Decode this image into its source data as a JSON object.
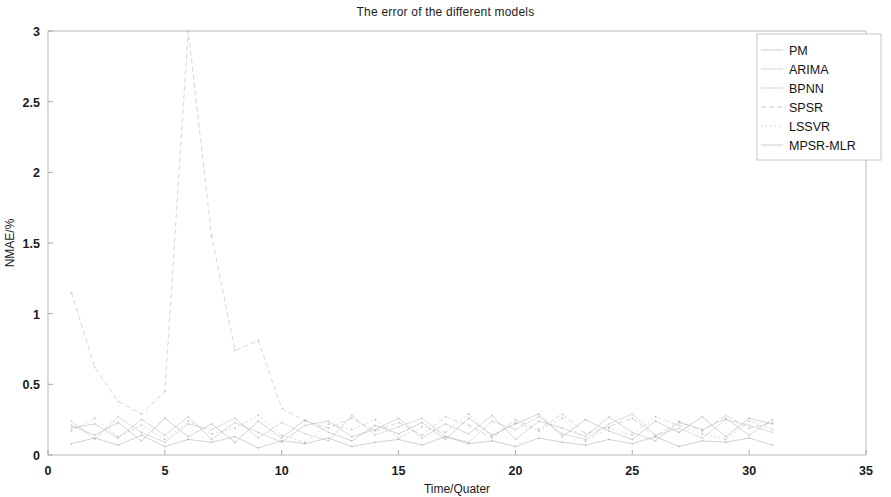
{
  "figure": {
    "title": "The error of the different models",
    "background_color": "#ffffff"
  },
  "axes": {
    "x_label": "Time/Quater",
    "y_label": "NMAE/%",
    "x_ticks": [
      "0",
      "5",
      "10",
      "15",
      "20",
      "25",
      "30",
      "35"
    ],
    "y_ticks": [
      "0",
      "0.5",
      "1",
      "1.5",
      "2",
      "2.5",
      "3"
    ],
    "axis_color": "#b9b9bd"
  },
  "legend": {
    "position": "top-right",
    "items": [
      {
        "label": "PM",
        "color": "#9d9da6",
        "style": "solid"
      },
      {
        "label": "ARIMA",
        "color": "#a8a8b2",
        "style": "solid"
      },
      {
        "label": "BPNN",
        "color": "#b0b0ba",
        "style": "solid"
      },
      {
        "label": "SPSR",
        "color": "#a3a3ae",
        "style": "dashed"
      },
      {
        "label": "LSSVR",
        "color": "#8f8fa0",
        "style": "dotted"
      },
      {
        "label": "MPSR-MLR",
        "color": "#9898a8",
        "style": "solid"
      }
    ]
  },
  "chart_data": {
    "type": "line",
    "title": "The error of the different models",
    "xlabel": "Time/Quater",
    "ylabel": "NMAE/%",
    "xlim": [
      0,
      35
    ],
    "ylim": [
      0,
      3
    ],
    "xticks": [
      0,
      5,
      10,
      15,
      20,
      25,
      30,
      35
    ],
    "yticks": [
      0,
      0.5,
      1,
      1.5,
      2,
      2.5,
      3
    ],
    "grid": false,
    "legend_position": "upper right",
    "x": [
      1,
      2,
      3,
      4,
      5,
      6,
      7,
      8,
      9,
      10,
      11,
      12,
      13,
      14,
      15,
      16,
      17,
      18,
      19,
      20,
      21,
      22,
      23,
      24,
      25,
      26,
      27,
      28,
      29,
      30,
      31
    ],
    "series": [
      {
        "name": "PM",
        "color": "#9d9da6",
        "values": [
          0.21,
          0.14,
          0.23,
          0.1,
          0.26,
          0.13,
          0.22,
          0.09,
          0.24,
          0.12,
          0.25,
          0.16,
          0.1,
          0.21,
          0.15,
          0.23,
          0.11,
          0.26,
          0.14,
          0.22,
          0.29,
          0.13,
          0.25,
          0.17,
          0.11,
          0.24,
          0.16,
          0.27,
          0.13,
          0.26,
          0.22
        ]
      },
      {
        "name": "ARIMA",
        "color": "#a8a8b2",
        "values": [
          0.19,
          0.22,
          0.12,
          0.25,
          0.14,
          0.27,
          0.11,
          0.23,
          0.16,
          0.09,
          0.21,
          0.24,
          0.13,
          0.18,
          0.26,
          0.12,
          0.22,
          0.15,
          0.28,
          0.11,
          0.24,
          0.19,
          0.13,
          0.27,
          0.16,
          0.1,
          0.23,
          0.18,
          0.26,
          0.14,
          0.25
        ]
      },
      {
        "name": "BPNN",
        "color": "#b0b0ba",
        "values": [
          0.24,
          0.11,
          0.27,
          0.16,
          0.09,
          0.22,
          0.18,
          0.26,
          0.12,
          0.23,
          0.15,
          0.1,
          0.28,
          0.14,
          0.2,
          0.26,
          0.13,
          0.09,
          0.24,
          0.18,
          0.27,
          0.15,
          0.11,
          0.22,
          0.29,
          0.14,
          0.19,
          0.12,
          0.25,
          0.21,
          0.16
        ]
      },
      {
        "name": "SPSR",
        "color": "#a3a3ae",
        "values": [
          1.15,
          0.62,
          0.38,
          0.29,
          0.45,
          3.0,
          1.55,
          0.74,
          0.81,
          0.33,
          0.24,
          0.19,
          0.26,
          0.17,
          0.23,
          0.14,
          0.27,
          0.21,
          0.12,
          0.25,
          0.18,
          0.29,
          0.15,
          0.2,
          0.26,
          0.13,
          0.24,
          0.17,
          0.28,
          0.19,
          0.23
        ]
      },
      {
        "name": "LSSVR",
        "color": "#8f8fa0",
        "values": [
          0.17,
          0.26,
          0.13,
          0.21,
          0.11,
          0.24,
          0.15,
          0.19,
          0.28,
          0.14,
          0.09,
          0.22,
          0.18,
          0.25,
          0.12,
          0.2,
          0.16,
          0.29,
          0.13,
          0.23,
          0.17,
          0.26,
          0.1,
          0.19,
          0.14,
          0.27,
          0.21,
          0.15,
          0.11,
          0.24,
          0.18
        ]
      },
      {
        "name": "MPSR-MLR",
        "color": "#9898a8",
        "values": [
          0.08,
          0.12,
          0.07,
          0.14,
          0.06,
          0.11,
          0.09,
          0.13,
          0.05,
          0.1,
          0.08,
          0.12,
          0.06,
          0.09,
          0.11,
          0.07,
          0.13,
          0.08,
          0.1,
          0.06,
          0.12,
          0.09,
          0.07,
          0.11,
          0.08,
          0.13,
          0.06,
          0.1,
          0.09,
          0.12,
          0.07
        ]
      }
    ]
  }
}
